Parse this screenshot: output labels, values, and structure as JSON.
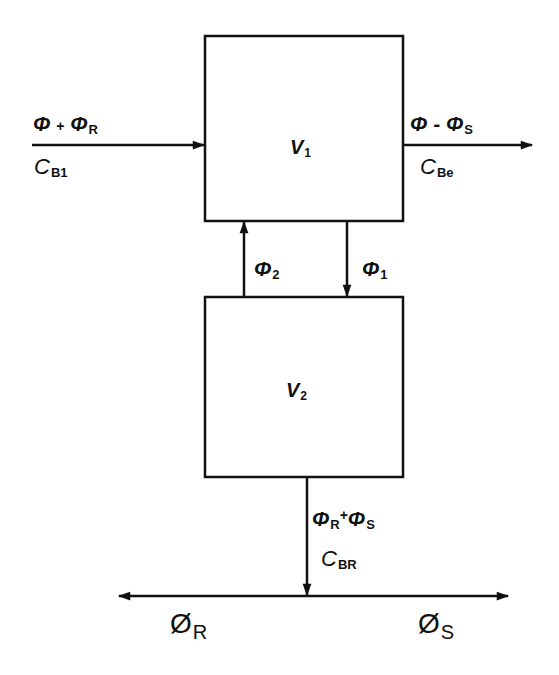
{
  "diagram": {
    "type": "two-compartment flow diagram",
    "boxes": [
      {
        "id": "V1",
        "label_main": "V",
        "label_sub": "1"
      },
      {
        "id": "V2",
        "label_main": "V",
        "label_sub": "2"
      }
    ],
    "flows": {
      "inflow": {
        "flow_main": "Φ",
        "op": "+",
        "flow2_main": "Φ",
        "flow2_sub": "R",
        "conc_main": "C",
        "conc_sub": "B1",
        "direction": "into V1"
      },
      "outflow": {
        "flow_main": "Φ",
        "op": "-",
        "flow2_main": "Φ",
        "flow2_sub": "S",
        "conc_main": "C",
        "conc_sub": "Be",
        "direction": "out of V1"
      },
      "v2_to_v1": {
        "main": "Φ",
        "sub": "2",
        "direction": "V2 to V1"
      },
      "v1_to_v2": {
        "main": "Φ",
        "sub": "1",
        "direction": "V1 to V2"
      },
      "v2_out": {
        "flow_main": "Φ",
        "flow_sub": "R",
        "op": "+",
        "flow2_main": "Φ",
        "flow2_sub": "S",
        "conc_main": "C",
        "conc_sub": "BR",
        "direction": "out of V2"
      },
      "split_left": {
        "main": "Ø",
        "sub": "R",
        "direction": "left"
      },
      "split_right": {
        "main": "Ø",
        "sub": "S",
        "direction": "right"
      }
    },
    "colors": {
      "line": "#111111",
      "background": "#ffffff"
    }
  }
}
